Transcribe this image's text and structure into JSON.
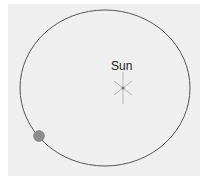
{
  "diagram": {
    "sun": {
      "label": "Sun",
      "x": 123,
      "y": 88
    },
    "orbit": {
      "cx": 105,
      "cy": 88,
      "rx": 85,
      "ry": 78,
      "color": "#555555"
    },
    "planet": {
      "x": 39,
      "y": 136,
      "r": 5.5,
      "color": "#8c8c8c"
    },
    "background": "#efefef"
  }
}
